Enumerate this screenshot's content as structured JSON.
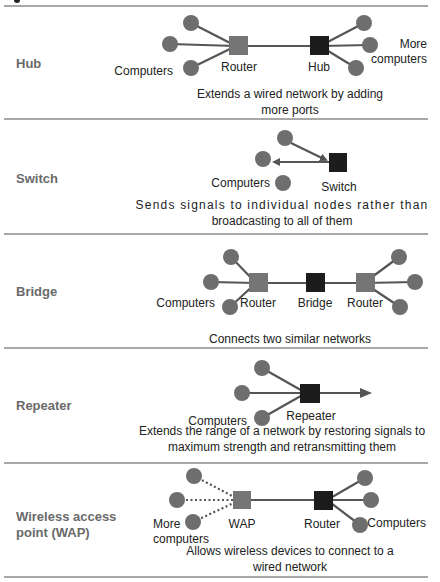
{
  "colors": {
    "computer": "#6e6e6e",
    "router": "#757575",
    "device_dark": "#1c1c1c",
    "line": "#555555",
    "divider": "#a8a8a8",
    "label": "#6a6a6a"
  },
  "rows": [
    {
      "label": "Hub",
      "caption_lines": [
        "Extends a wired network by adding",
        "more ports"
      ],
      "nodes": {
        "computers": "Computers",
        "router": "Router",
        "device": "Hub",
        "more_line1": "More",
        "more_line2": "computers"
      }
    },
    {
      "label": "Switch",
      "caption_lines": [
        "Sends signals to individual nodes rather than",
        "broadcasting to all of them"
      ],
      "nodes": {
        "computers": "Computers",
        "device": "Switch"
      }
    },
    {
      "label": "Bridge",
      "caption_lines": [
        "Connects two similar networks"
      ],
      "nodes": {
        "computers": "Computers",
        "router1": "Router",
        "device": "Bridge",
        "router2": "Router"
      }
    },
    {
      "label": "Repeater",
      "caption_lines": [
        "Extends the range of a network by restoring signals to",
        "maximum strength and retransmitting them"
      ],
      "nodes": {
        "computers": "Computers",
        "device": "Repeater"
      }
    },
    {
      "label_lines": [
        "Wireless access",
        "point (WAP)"
      ],
      "caption_lines": [
        "Allows wireless devices to connect to a",
        "wired network"
      ],
      "nodes": {
        "more_line1": "More",
        "more_line2": "computers",
        "wap": "WAP",
        "device": "Router",
        "computers": "Computers"
      }
    }
  ]
}
